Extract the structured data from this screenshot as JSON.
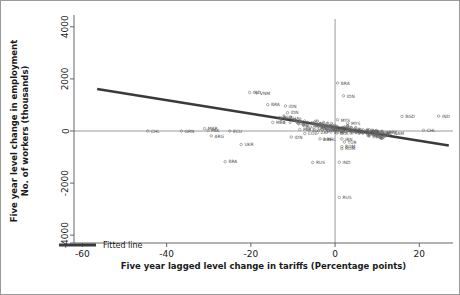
{
  "figure": {
    "background_color": "#ffffff",
    "frame_color": "#9a9a9a",
    "axis_color": "#555555",
    "fit_line_color": "#3a3a3a",
    "marker_color": "#6b6b6b",
    "label_color": "#4a4a4a"
  },
  "chart_data": {
    "type": "scatter",
    "title": "",
    "xlabel": "Five year lagged level change in tariffs (Percentage points)",
    "ylabel": "Five year level change in employment\nNo. of workers (thousands)",
    "ylabel_line1": "Five year level change in employment",
    "ylabel_line2": "No. of workers (thousands)",
    "xlim": [
      -62,
      28
    ],
    "ylim": [
      -4300,
      4300
    ],
    "xticks": [
      -60,
      -40,
      -20,
      0,
      20
    ],
    "xtick_labels": [
      "-60",
      "-40",
      "-20",
      "0",
      "20"
    ],
    "yticks": [
      -4000,
      -2000,
      0,
      2000,
      4000
    ],
    "ytick_labels": [
      "-4000",
      "-2000",
      "0",
      "2000",
      "4000"
    ],
    "grid": false,
    "zero_lines": {
      "x": 0,
      "y": 0
    },
    "legend": {
      "position": "bottom-left-inside",
      "entries": [
        {
          "label": "Fitted line",
          "type": "line",
          "color": "#3a3a3a"
        }
      ]
    },
    "fit_line": {
      "name": "Fitted line",
      "x_start": -56.5,
      "y_start": 1610,
      "x_end": 27.0,
      "y_end": -560,
      "slope": -26.0,
      "intercept": 140
    },
    "series": [
      {
        "name": "Countries",
        "point_label_field": "iso3",
        "points": [
          {
            "iso3": "IND",
            "x": -20.3,
            "y": 1480
          },
          {
            "iso3": "VNM",
            "x": -18.6,
            "y": 1460
          },
          {
            "iso3": "BRA",
            "x": -16.0,
            "y": 1010
          },
          {
            "iso3": "IDN",
            "x": -11.8,
            "y": 960
          },
          {
            "iso3": "IDN",
            "x": -11.3,
            "y": 700
          },
          {
            "iso3": "BGD",
            "x": -13.2,
            "y": 520
          },
          {
            "iso3": "GHA",
            "x": -11.6,
            "y": 500
          },
          {
            "iso3": "MEX",
            "x": -14.8,
            "y": 330
          },
          {
            "iso3": "BRA",
            "x": 0.6,
            "y": 1840
          },
          {
            "iso3": "IDN",
            "x": 2.0,
            "y": 1350
          },
          {
            "iso3": "BGD",
            "x": 15.9,
            "y": 560
          },
          {
            "iso3": "IND",
            "x": 24.6,
            "y": 570
          },
          {
            "iso3": "MYS",
            "x": 0.6,
            "y": 430
          },
          {
            "iso3": "MYS",
            "x": 3.0,
            "y": 300
          },
          {
            "iso3": "CHL",
            "x": 21.0,
            "y": 25
          },
          {
            "iso3": "CHL",
            "x": -44.5,
            "y": 0
          },
          {
            "iso3": "GRN",
            "x": -36.5,
            "y": 0
          },
          {
            "iso3": "MAR",
            "x": -31.0,
            "y": 90
          },
          {
            "iso3": "PAK",
            "x": -30.2,
            "y": 20
          },
          {
            "iso3": "ARG",
            "x": -29.4,
            "y": -190
          },
          {
            "iso3": "ECU",
            "x": -25.0,
            "y": 0
          },
          {
            "iso3": "UKR",
            "x": -22.3,
            "y": -520
          },
          {
            "iso3": "BRA",
            "x": -26.1,
            "y": -1180
          },
          {
            "iso3": "IDN",
            "x": -10.4,
            "y": -230
          },
          {
            "iso3": "ARE",
            "x": -3.6,
            "y": -300
          },
          {
            "iso3": "PHL",
            "x": -2.6,
            "y": -310
          },
          {
            "iso3": "RUS",
            "x": -5.3,
            "y": -1210
          },
          {
            "iso3": "IND",
            "x": 1.0,
            "y": -1200
          },
          {
            "iso3": "RUS",
            "x": 1.0,
            "y": -2550
          },
          {
            "iso3": "IRN",
            "x": 1.6,
            "y": -300
          },
          {
            "iso3": "ROM",
            "x": 1.6,
            "y": -600
          },
          {
            "iso3": "ROM",
            "x": 1.6,
            "y": -680
          },
          {
            "iso3": "TUR",
            "x": 2.2,
            "y": -420
          },
          {
            "iso3": "COL",
            "x": -7.2,
            "y": -100
          },
          {
            "iso3": "PER",
            "x": -8.4,
            "y": 60
          },
          {
            "iso3": "EGY",
            "x": -6.2,
            "y": 40
          },
          {
            "iso3": "THA",
            "x": -5.0,
            "y": 120
          },
          {
            "iso3": "ZAF",
            "x": -4.2,
            "y": -60
          },
          {
            "iso3": "KEN",
            "x": -3.0,
            "y": 40
          },
          {
            "iso3": "NGA",
            "x": -1.8,
            "y": 80
          },
          {
            "iso3": "ETH",
            "x": -1.0,
            "y": -40
          },
          {
            "iso3": "CHN",
            "x": -0.4,
            "y": 100
          },
          {
            "iso3": "BOL",
            "x": 0.4,
            "y": -80
          },
          {
            "iso3": "POL",
            "x": 1.2,
            "y": 40
          },
          {
            "iso3": "HUN",
            "x": 2.6,
            "y": -30
          },
          {
            "iso3": "CZE",
            "x": 3.8,
            "y": 20
          },
          {
            "iso3": "KOR",
            "x": 5.0,
            "y": -40
          },
          {
            "iso3": "TUN",
            "x": 6.4,
            "y": -60
          },
          {
            "iso3": "JOR",
            "x": 7.8,
            "y": -20
          },
          {
            "iso3": "LKA",
            "x": 9.2,
            "y": -80
          },
          {
            "iso3": "URY",
            "x": 10.6,
            "y": -100
          },
          {
            "iso3": "PRY",
            "x": 12.0,
            "y": -60
          },
          {
            "iso3": "NAM",
            "x": 13.2,
            "y": -90
          }
        ]
      }
    ]
  }
}
